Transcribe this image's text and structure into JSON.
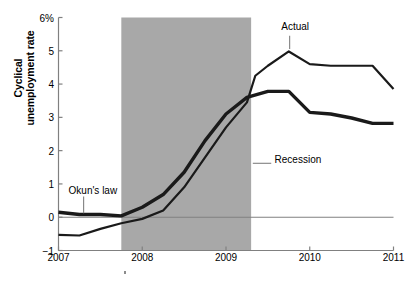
{
  "chart_data": {
    "type": "line",
    "title": "",
    "xlabel": "",
    "ylabel": "Cyclical unemployment rate",
    "ylabel_line1": "Cyclical",
    "ylabel_line2": "unemployment rate",
    "xlim": [
      2007,
      2011
    ],
    "ylim": [
      -1,
      6
    ],
    "grid": false,
    "legend_position": "inline-annotations",
    "yticks": [
      {
        "value": 6,
        "label": "6%"
      },
      {
        "value": 5,
        "label": "5"
      },
      {
        "value": 4,
        "label": "4"
      },
      {
        "value": 3,
        "label": "3"
      },
      {
        "value": 2,
        "label": "2"
      },
      {
        "value": 1,
        "label": "1"
      },
      {
        "value": 0,
        "label": "0"
      },
      {
        "value": -1,
        "label": "−1"
      }
    ],
    "xticks": [
      {
        "value": 2007,
        "label": "2007"
      },
      {
        "value": 2008,
        "label": "2008"
      },
      {
        "value": 2009,
        "label": "2009"
      },
      {
        "value": 2010,
        "label": "2010"
      },
      {
        "value": 2011,
        "label": "2011"
      }
    ],
    "zero_line": 0,
    "shaded_regions": [
      {
        "name": "Recession",
        "x_start": 2007.75,
        "x_end": 2009.3,
        "color": "#a8a8a8"
      }
    ],
    "series": [
      {
        "name": "Actual",
        "color": "#1a1a1a",
        "linewidth": 2.2,
        "x": [
          2007.0,
          2007.25,
          2007.5,
          2007.75,
          2008.0,
          2008.25,
          2008.5,
          2008.75,
          2009.0,
          2009.25,
          2009.35,
          2009.5,
          2009.75,
          2010.0,
          2010.25,
          2010.5,
          2010.75,
          2011.0
        ],
        "y": [
          -0.53,
          -0.55,
          -0.35,
          -0.18,
          -0.05,
          0.2,
          0.9,
          1.8,
          2.7,
          3.45,
          4.25,
          4.55,
          4.98,
          4.6,
          4.55,
          4.55,
          4.55,
          3.85
        ]
      },
      {
        "name": "Okun's law",
        "color": "#1a1a1a",
        "linewidth": 3.4,
        "x": [
          2007.0,
          2007.25,
          2007.5,
          2007.75,
          2008.0,
          2008.25,
          2008.5,
          2008.75,
          2009.0,
          2009.25,
          2009.5,
          2009.75,
          2010.0,
          2010.25,
          2010.5,
          2010.75,
          2011.0
        ],
        "y": [
          0.15,
          0.08,
          0.08,
          0.04,
          0.3,
          0.68,
          1.35,
          2.3,
          3.1,
          3.6,
          3.78,
          3.78,
          3.15,
          3.1,
          2.98,
          2.82,
          2.82
        ]
      }
    ],
    "annotations": [
      {
        "name": "Okun's law",
        "text": "Okun's law",
        "x_text": 2007.12,
        "y_text": 0.8,
        "leader_from": [
          2007.3,
          0.62
        ],
        "leader_to": [
          2007.3,
          0.12
        ],
        "leader_color": "#808080"
      },
      {
        "name": "Actual",
        "text": "Actual",
        "x_text": 2009.66,
        "y_text": 5.7,
        "leader_from": [
          2009.76,
          5.45
        ],
        "leader_to": [
          2009.76,
          5.05
        ],
        "leader_color": "#808080"
      },
      {
        "name": "Recession",
        "text": "Recession",
        "x_text": 2009.58,
        "y_text": 1.72,
        "leader_from": [
          2009.32,
          1.62
        ],
        "leader_to": [
          2009.54,
          1.62
        ],
        "leader_color": "#808080"
      }
    ],
    "axis_color": "#808080",
    "zero_line_color": "#808080",
    "background": "#ffffff"
  }
}
